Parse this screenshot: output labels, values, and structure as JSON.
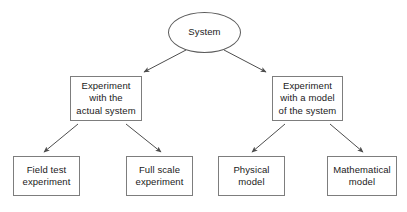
{
  "diagram": {
    "canvas": {
      "width": 407,
      "height": 212,
      "background": "#ffffff"
    },
    "style": {
      "box_border_color": "#7d7d7d",
      "ellipse_border_color": "#5a5a5a",
      "edge_color": "#4d4d4d",
      "text_color": "#1a1a1a"
    },
    "nodes": [
      {
        "id": "system",
        "label": "System",
        "shape": "ellipse",
        "x": 168,
        "y": 12,
        "w": 73,
        "h": 41,
        "level": 0
      },
      {
        "id": "experiment-actual",
        "label": "Experiment\nwith the\nactual system",
        "shape": "rect",
        "x": 70,
        "y": 76,
        "w": 72,
        "h": 45,
        "level": 1
      },
      {
        "id": "experiment-model",
        "label": "Experiment\nwith a model\nof the system",
        "shape": "rect",
        "x": 272,
        "y": 76,
        "w": 71,
        "h": 45,
        "level": 1
      },
      {
        "id": "field-test",
        "label": "Field test\nexperiment",
        "shape": "rect",
        "x": 13,
        "y": 156,
        "w": 67,
        "h": 40,
        "level": 2
      },
      {
        "id": "full-scale",
        "label": "Full scale\nexperiment",
        "shape": "rect",
        "x": 126,
        "y": 156,
        "w": 67,
        "h": 40,
        "level": 2
      },
      {
        "id": "physical-model",
        "label": "Physical\nmodel",
        "shape": "rect",
        "x": 218,
        "y": 156,
        "w": 67,
        "h": 40,
        "level": 2
      },
      {
        "id": "mathematical-model",
        "label": "Mathematical\nmodel",
        "shape": "rect",
        "x": 327,
        "y": 156,
        "w": 70,
        "h": 40,
        "level": 2
      }
    ],
    "edges": [
      {
        "id": "system-to-experiment-actual",
        "from": "system",
        "to": "experiment-actual",
        "x1": 186,
        "y1": 50,
        "x2": 144,
        "y2": 72,
        "arrow": "end"
      },
      {
        "id": "system-to-experiment-model",
        "from": "system",
        "to": "experiment-model",
        "x1": 224,
        "y1": 50,
        "x2": 266,
        "y2": 72,
        "arrow": "end"
      },
      {
        "id": "experiment-actual-to-field-test",
        "from": "experiment-actual",
        "to": "field-test",
        "x1": 78,
        "y1": 124,
        "x2": 44,
        "y2": 152,
        "arrow": "end"
      },
      {
        "id": "experiment-actual-to-full-scale",
        "from": "experiment-actual",
        "to": "full-scale",
        "x1": 126,
        "y1": 124,
        "x2": 161,
        "y2": 152,
        "arrow": "end"
      },
      {
        "id": "experiment-model-to-physical-model",
        "from": "experiment-model",
        "to": "physical-model",
        "x1": 285,
        "y1": 124,
        "x2": 252,
        "y2": 152,
        "arrow": "end"
      },
      {
        "id": "experiment-model-to-mathematical-model",
        "from": "experiment-model",
        "to": "mathematical-model",
        "x1": 330,
        "y1": 124,
        "x2": 363,
        "y2": 152,
        "arrow": "end"
      }
    ]
  }
}
